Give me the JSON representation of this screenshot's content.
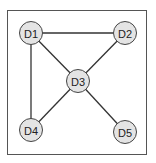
{
  "diagram": {
    "type": "graph",
    "colors": {
      "border": "#555555",
      "edge": "#333333",
      "node_fill": "#e4e4e4",
      "node_stroke": "#444444",
      "label": "#222222"
    },
    "nodes": [
      {
        "id": "D1",
        "label": "D1",
        "x": 31,
        "y": 33
      },
      {
        "id": "D2",
        "label": "D2",
        "x": 125,
        "y": 33
      },
      {
        "id": "D3",
        "label": "D3",
        "x": 78,
        "y": 81
      },
      {
        "id": "D4",
        "label": "D4",
        "x": 31,
        "y": 130
      },
      {
        "id": "D5",
        "label": "D5",
        "x": 125,
        "y": 132
      }
    ],
    "edges": [
      {
        "from": "D1",
        "to": "D2"
      },
      {
        "from": "D1",
        "to": "D3"
      },
      {
        "from": "D1",
        "to": "D4"
      },
      {
        "from": "D2",
        "to": "D3"
      },
      {
        "from": "D3",
        "to": "D4"
      },
      {
        "from": "D3",
        "to": "D5"
      }
    ]
  }
}
